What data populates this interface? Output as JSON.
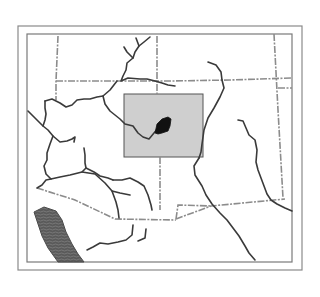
{
  "map": {
    "title": "",
    "colors": {
      "background": "#ffffff",
      "frame_outer": "#8a8a8a",
      "frame_inner": "#7a7a7a",
      "river": "#3a3a3a",
      "boundary": "#8c8c8c",
      "highlight_box_fill": "#cfcfcf",
      "highlight_box_stroke": "#555555",
      "focus_area": "#111111",
      "water_body": "#555555"
    },
    "frame": {
      "outer": {
        "x": 18,
        "y": 26,
        "w": 284,
        "h": 244
      },
      "inner": {
        "x": 27,
        "y": 34,
        "w": 265,
        "h": 228
      }
    },
    "highlight_box": {
      "x": 124,
      "y": 94,
      "w": 79,
      "h": 63,
      "label": ""
    },
    "focus_area": {
      "label": ""
    },
    "water_body": {
      "label": ""
    }
  }
}
